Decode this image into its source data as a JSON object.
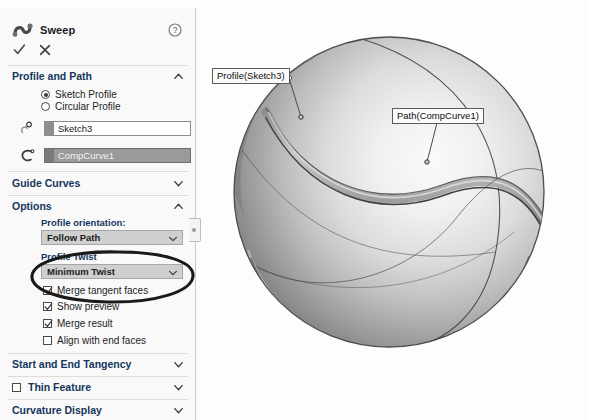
{
  "app": {
    "dialog_title": "Sweep",
    "sweep_icon": "sweep-icon",
    "help_icon": "help-question-icon",
    "accept_label": "OK",
    "cancel_label": "Cancel"
  },
  "sections": {
    "profile_and_path": {
      "title": "Profile and Path",
      "expanded": true,
      "chevron": "chevron-up-icon",
      "radios": [
        {
          "label": "Sketch Profile",
          "selected": true
        },
        {
          "label": "Circular Profile",
          "selected": false
        }
      ],
      "fields": [
        {
          "icon": "profile-selection-icon",
          "value": "Sketch3",
          "selected": false
        },
        {
          "icon": "path-selection-icon",
          "value": "CompCurve1",
          "selected": true
        }
      ]
    },
    "guide_curves": {
      "title": "Guide Curves",
      "expanded": false,
      "chevron": "chevron-down-icon"
    },
    "options": {
      "title": "Options",
      "expanded": true,
      "chevron": "chevron-up-icon",
      "profile_orientation_label": "Profile orientation:",
      "profile_orientation_value": "Follow Path",
      "profile_twist_label": "Profile Twist",
      "profile_twist_value": "Minimum Twist",
      "checkboxes": [
        {
          "label": "Merge tangent faces",
          "checked": true
        },
        {
          "label": "Show preview",
          "checked": true
        },
        {
          "label": "Merge result",
          "checked": true
        },
        {
          "label": "Align with end faces",
          "checked": false
        }
      ]
    },
    "start_and_end_tangency": {
      "title": "Start and End Tangency",
      "expanded": false,
      "chevron": "chevron-down-icon"
    },
    "thin_feature": {
      "title": "Thin Feature",
      "expanded": false,
      "checked": false,
      "chevron": "chevron-down-icon"
    },
    "curvature_display": {
      "title": "Curvature Display",
      "expanded": false,
      "chevron": "chevron-down-icon"
    }
  },
  "viewport": {
    "callouts": [
      {
        "text": "Profile(Sketch3)"
      },
      {
        "text": "Path(CompCurve1)"
      }
    ],
    "model_name": "swept-groove-sphere"
  },
  "annotation": {
    "highlight_shape": "hand-drawn-ellipse",
    "highlight_target": "Merge tangent faces"
  },
  "colors": {
    "panel_bg": "#f9f9f9",
    "section_title": "#14365c",
    "selected_field_bg": "#9a9a9a",
    "combo_bg": "#cfcfcf",
    "annotation_stroke": "#1a1a1a",
    "viewport_bg": "#fdfdfd"
  }
}
